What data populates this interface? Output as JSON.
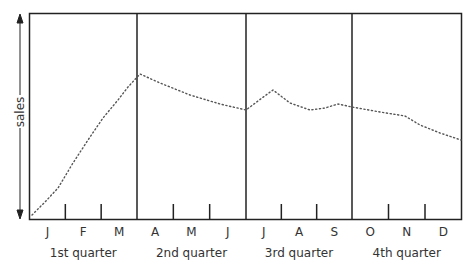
{
  "chart_data": {
    "type": "line",
    "title": "",
    "xlabel": "",
    "ylabel": "sales",
    "months": [
      "J",
      "F",
      "M",
      "A",
      "M",
      "J",
      "J",
      "A",
      "S",
      "O",
      "N",
      "D"
    ],
    "quarters": [
      "1st quarter",
      "2nd quarter",
      "3rd quarter",
      "4th quarter"
    ],
    "series": [
      {
        "name": "sales",
        "style": "dotted",
        "points_px": [
          [
            32,
            215
          ],
          [
            45,
            202
          ],
          [
            58,
            188
          ],
          [
            73,
            163
          ],
          [
            88,
            140
          ],
          [
            103,
            118
          ],
          [
            118,
            100
          ],
          [
            128,
            87
          ],
          [
            140,
            74
          ],
          [
            160,
            83
          ],
          [
            190,
            95
          ],
          [
            220,
            104
          ],
          [
            246,
            110
          ],
          [
            262,
            98
          ],
          [
            273,
            90
          ],
          [
            290,
            103
          ],
          [
            310,
            110
          ],
          [
            325,
            108
          ],
          [
            338,
            104
          ],
          [
            352,
            107
          ],
          [
            380,
            112
          ],
          [
            405,
            116
          ],
          [
            420,
            125
          ],
          [
            440,
            133
          ],
          [
            461,
            140
          ]
        ]
      }
    ],
    "grid": false,
    "legend": "none",
    "y_arrow": true
  }
}
